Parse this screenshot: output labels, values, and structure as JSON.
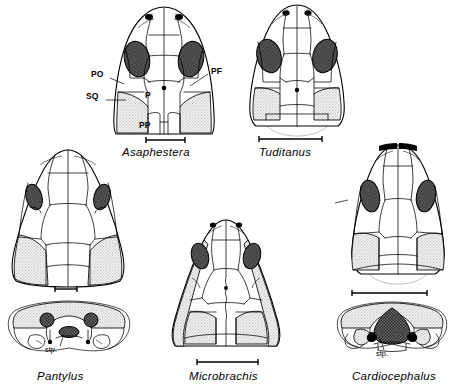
{
  "figure": {
    "background_color": "#ffffff",
    "ink_color": "#000000",
    "orbit_fill_color": "#555555",
    "squamosal_fill_color": "#e2e2e2",
    "ghost_outline_color": "#9a9a9a"
  },
  "bone_labels": [
    {
      "key": "PO",
      "text": "PO",
      "meaning": "postorbital",
      "x": 91,
      "y": 74
    },
    {
      "key": "SQ",
      "text": "SQ",
      "meaning": "squamosal",
      "x": 86,
      "y": 96
    },
    {
      "key": "P",
      "text": "P",
      "meaning": "parietal",
      "x": 146,
      "y": 95
    },
    {
      "key": "PP",
      "text": "PP",
      "meaning": "postparietal",
      "x": 141,
      "y": 125
    },
    {
      "key": "PF",
      "text": "PF",
      "meaning": "postfrontal",
      "x": 212,
      "y": 68
    }
  ],
  "specimens": [
    {
      "id": "asaphestera",
      "name": "Asaphestera",
      "view": "dorsal",
      "label_x": 124,
      "label_y": 148,
      "scalebar": {
        "x": 145,
        "y": 140,
        "length": 40
      }
    },
    {
      "id": "tuditanus",
      "name": "Tuditanus",
      "view": "dorsal",
      "label_x": 261,
      "label_y": 148,
      "scalebar": {
        "x": 259,
        "y": 139,
        "length": 64
      }
    },
    {
      "id": "pantylus",
      "name": "Pantylus",
      "view": "dorsal + occipital",
      "label_x": 38,
      "label_y": 375,
      "scalebar": {
        "x": 55,
        "y": 288,
        "length": 23
      },
      "occipital_label": "stp.",
      "occipital_label_x": 47,
      "occipital_label_y": 349
    },
    {
      "id": "microbrachis",
      "name": "Microbrachis",
      "view": "dorsal",
      "label_x": 191,
      "label_y": 377,
      "scalebar": {
        "x": 196,
        "y": 362,
        "length": 62
      }
    },
    {
      "id": "cardiocephalus",
      "name": "Cardiocephalus",
      "view": "dorsal + occipital",
      "label_x": 355,
      "label_y": 376,
      "scalebar": {
        "x": 352,
        "y": 293,
        "length": 76
      },
      "occipital_label": "stp.",
      "occipital_label_x": 378,
      "occipital_label_y": 353
    }
  ]
}
